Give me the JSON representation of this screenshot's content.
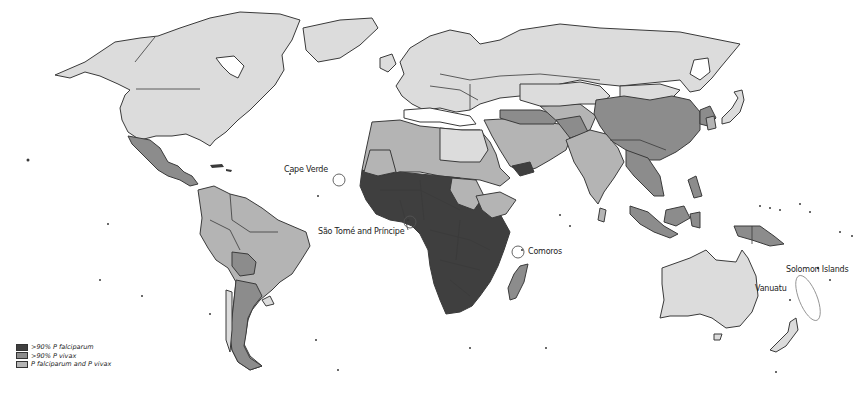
{
  "map": {
    "title": "",
    "type": "choropleth",
    "colors": {
      "falciparum": "#3f3f3f",
      "vivax": "#8c8c8c",
      "mixed": "#b4b4b4",
      "no_risk": "#dcdcdc",
      "water": "#ffffff",
      "border": "#3a3a3a"
    }
  },
  "legend": {
    "items": [
      {
        "label": ">90% P falciparum",
        "key": "falciparum",
        "color": "#3f3f3f"
      },
      {
        "label": ">90% P vivax",
        "key": "vivax",
        "color": "#8c8c8c"
      },
      {
        "label": "P falciparum and P vivax",
        "key": "mixed",
        "color": "#b4b4b4"
      }
    ]
  },
  "callouts": {
    "cape_verde": "Cape Verde",
    "sao_tome": "São Tomé and Príncipe",
    "comoros": "Comoros",
    "solomon_islands": "Solomon Islands",
    "vanuatu": "Vanuatu"
  }
}
